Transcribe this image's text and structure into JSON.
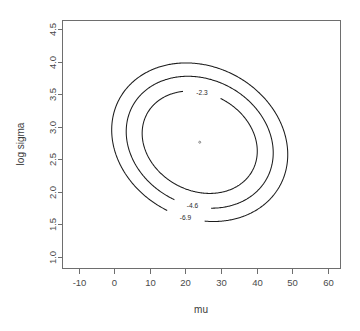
{
  "chart_data": {
    "type": "line",
    "subtype": "contour",
    "title": "",
    "xlabel": "mu",
    "ylabel": "log sigma",
    "xlim": [
      -14.5,
      63.5
    ],
    "ylim": [
      0.82,
      4.63
    ],
    "xticks": [
      -10,
      0,
      10,
      20,
      30,
      40,
      50,
      60
    ],
    "xtick_labels": [
      "-10",
      "0",
      "10",
      "20",
      "30",
      "40",
      "50",
      "60"
    ],
    "yticks": [
      1.0,
      1.5,
      2.0,
      2.5,
      3.0,
      3.5,
      4.0,
      4.5
    ],
    "ytick_labels": [
      "1.0",
      "1.5",
      "2.0",
      "2.5",
      "3.0",
      "3.5",
      "4.0",
      "4.5"
    ],
    "grid": false,
    "legend": "none",
    "box": true,
    "center": {
      "mu": 24.0,
      "log_sigma": 2.76
    },
    "contours": [
      {
        "level": -2.3,
        "label": "-2.3",
        "label_at": {
          "mu": 24.6,
          "log_sigma": 3.53
        },
        "semi_major": 16.8,
        "semi_minor": 13.6,
        "rotation_deg": -28
      },
      {
        "level": -4.6,
        "label": "-4.6",
        "label_at": {
          "mu": 21.5,
          "log_sigma": 1.65
        },
        "semi_major": 21.4,
        "semi_minor": 17.6,
        "rotation_deg": -28
      },
      {
        "level": -6.9,
        "label": "-6.9",
        "label_at": {
          "mu": 19.0,
          "log_sigma": 1.41
        },
        "semi_major": 25.6,
        "semi_minor": 21.2,
        "rotation_deg": -28
      }
    ],
    "colors": {
      "background": "#ffffff",
      "contour_line": "#1c1c1c",
      "axis": "#6e6e6e",
      "tick_text": "#4a4a4a",
      "axis_title": "#3c3c3c"
    }
  }
}
